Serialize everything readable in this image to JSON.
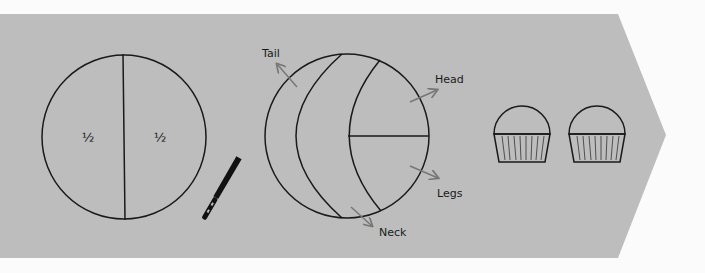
{
  "diagram": {
    "background_color": "#bdbdbd",
    "page_color": "#fbfbfb",
    "line_color": "#1a1a1a",
    "arrow_color": "#777777",
    "cake_halves": {
      "left_label": "½",
      "right_label": "½"
    },
    "knife": {
      "icon": "bread-knife-icon"
    },
    "cut_cake": {
      "labels": {
        "tail": "Tail",
        "head": "Head",
        "legs": "Legs",
        "neck": "Neck"
      }
    },
    "cupcakes": {
      "count": 2,
      "icon": "cupcake-icon"
    }
  }
}
